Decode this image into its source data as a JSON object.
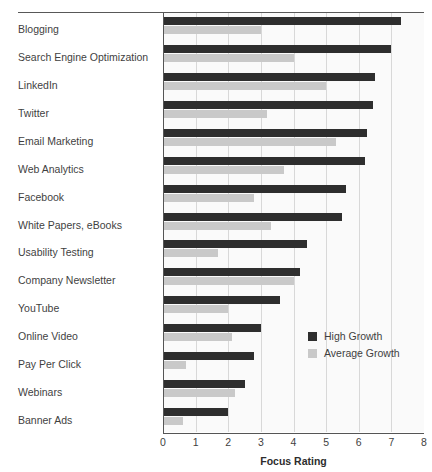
{
  "chart_data": {
    "type": "bar",
    "orientation": "horizontal",
    "title": "",
    "xlabel": "Focus Rating",
    "ylabel": "",
    "xlim": [
      0,
      8
    ],
    "xticks": [
      0,
      1,
      2,
      3,
      4,
      5,
      6,
      7,
      8
    ],
    "grid": true,
    "legend_position": "middle-right",
    "categories": [
      "Blogging",
      "Search Engine Optimization",
      "LinkedIn",
      "Twitter",
      "Email Marketing",
      "Web Analytics",
      "Facebook",
      "White Papers, eBooks",
      "Usability Testing",
      "Company Newsletter",
      "YouTube",
      "Online Video",
      "Pay Per Click",
      "Webinars",
      "Banner Ads"
    ],
    "series": [
      {
        "name": "High Growth",
        "color": "#2e2e2e",
        "values": [
          7.3,
          7.0,
          6.5,
          6.45,
          6.25,
          6.2,
          5.6,
          5.5,
          4.4,
          4.2,
          3.6,
          3.0,
          2.8,
          2.5,
          2.0
        ]
      },
      {
        "name": "Average Growth",
        "color": "#c9c9c9",
        "values": [
          3.0,
          4.0,
          5.0,
          3.2,
          5.3,
          3.7,
          2.8,
          3.3,
          1.7,
          4.0,
          2.0,
          2.1,
          0.7,
          2.2,
          0.6
        ]
      }
    ]
  }
}
